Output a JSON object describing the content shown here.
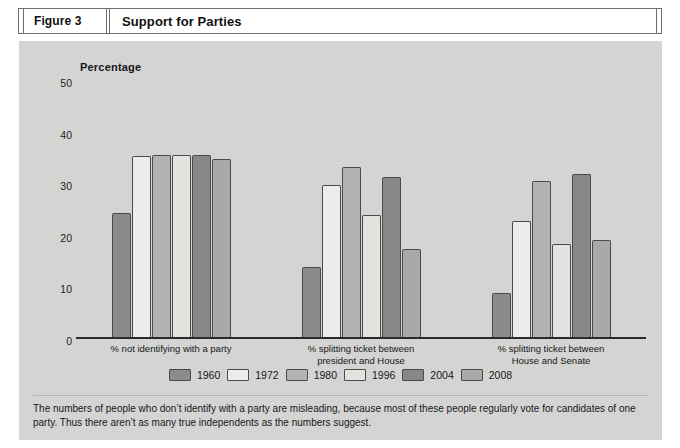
{
  "figure": {
    "number_label": "Figure 3",
    "title": "Support for Parties"
  },
  "caption": "The numbers of people who don’t identify with a party are misleading, because most of these people regularly vote for candidates of one party. Thus there aren’t as many true independents as the numbers suggest.",
  "colors": {
    "panel_background": "#d4d4d2",
    "page_background": "#ffffff",
    "axis": "#2a2a2a",
    "bar_border": "#4a4a4a",
    "text": "#17171b"
  },
  "chart_data": {
    "type": "bar",
    "title": "Support for Parties",
    "xlabel": "",
    "ylabel": "Percentage",
    "ylim": [
      0,
      50
    ],
    "yticks": [
      0,
      10,
      20,
      30,
      40,
      50
    ],
    "grid": false,
    "legend_position": "bottom",
    "categories": [
      "% not identifying with a party",
      "% splitting ticket between president and House",
      "% splitting ticket between House and Senate"
    ],
    "category_lines": [
      [
        "% not identifying with a party"
      ],
      [
        "% splitting ticket between",
        "president and House"
      ],
      [
        "% splitting ticket between",
        "House and Senate"
      ]
    ],
    "series": [
      {
        "name": "1960",
        "color": "#8b8b8b",
        "values": [
          24.0,
          13.5,
          8.5
        ]
      },
      {
        "name": "1972",
        "color": "#ececeb",
        "values": [
          35.0,
          29.5,
          22.5
        ]
      },
      {
        "name": "1980",
        "color": "#b2b2b0",
        "values": [
          35.3,
          33.0,
          30.2
        ]
      },
      {
        "name": "1996",
        "color": "#e2e2df",
        "values": [
          35.3,
          23.7,
          18.0
        ]
      },
      {
        "name": "2004",
        "color": "#878787",
        "values": [
          35.3,
          31.0,
          31.5
        ]
      },
      {
        "name": "2008",
        "color": "#a9a9a7",
        "values": [
          34.5,
          17.0,
          18.8
        ]
      }
    ]
  }
}
